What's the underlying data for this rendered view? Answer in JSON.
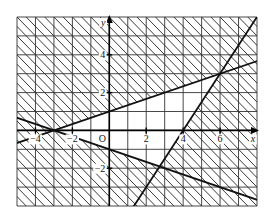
{
  "chart_data": {
    "type": "line",
    "title": "",
    "xlabel": "x",
    "ylabel": "y",
    "origin_label": "O",
    "xlim": [
      -5,
      8
    ],
    "ylim": [
      -4,
      6
    ],
    "grid": true,
    "grid_step": 1,
    "x_ticks": [
      -4,
      -2,
      2,
      4,
      6
    ],
    "x_tick_labels": [
      "−4",
      "−2",
      "2",
      "4",
      "6"
    ],
    "y_ticks": [
      4,
      2,
      -2
    ],
    "y_tick_labels": [
      "4",
      "2",
      "−2"
    ],
    "series": [
      {
        "name": "line-1",
        "equation": "y = (x + 3) / 3",
        "points": [
          [
            -5,
            -0.667
          ],
          [
            -3,
            0
          ],
          [
            0,
            1
          ],
          [
            6,
            3
          ],
          [
            8,
            3.667
          ]
        ]
      },
      {
        "name": "line-2",
        "equation": "y = 1.5x - 6",
        "points": [
          [
            2,
            -3
          ],
          [
            4,
            0
          ],
          [
            6,
            3
          ],
          [
            7.33,
            5
          ]
        ]
      },
      {
        "name": "line-3",
        "equation": "y = -(x + 3) / 3",
        "points": [
          [
            -5,
            0.667
          ],
          [
            -3,
            0
          ],
          [
            0,
            -1
          ],
          [
            8,
            -3.667
          ]
        ]
      }
    ],
    "intersections": [
      [
        -3,
        0
      ],
      [
        6,
        3
      ],
      [
        2.73,
        -1.91
      ]
    ],
    "hatching": {
      "style": "diagonal",
      "unshaded_region": "triangle bounded by line-1 (above), line-3 (below), line-2 (right) with vertex at (-3,0)"
    },
    "colors": {
      "line": "#111111",
      "grid": "#333333",
      "hatch": "#222222"
    }
  }
}
